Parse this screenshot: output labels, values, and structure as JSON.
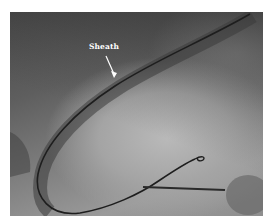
{
  "image": {
    "kind": "fluoroscopy",
    "annotations": [
      {
        "label": "Sheath",
        "pointer": "arrow"
      }
    ]
  }
}
